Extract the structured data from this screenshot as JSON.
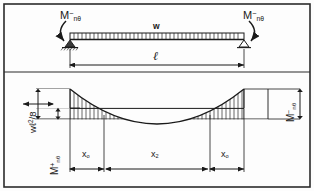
{
  "figure": {
    "kind": "structural-engineering-diagram",
    "border_color": "#2b2b2b",
    "line_color": "#1a1a1a",
    "background": "#fdfdfd"
  },
  "beam_panel": {
    "moment_left_label": "M",
    "moment_left_sup": "−",
    "moment_left_sub": "nθ",
    "moment_right_label": "M",
    "moment_right_sup": "−",
    "moment_right_sub": "nθ",
    "load_label": "w",
    "span_label": "ℓ",
    "left_support": "pinned-support",
    "right_support": "roller-support",
    "load_type": "uniformly-distributed-load"
  },
  "moment_panel": {
    "peak_label": "wℓ2/8",
    "peak_label_base": "wℓ",
    "peak_label_exp": "2",
    "peak_label_tail": "/8",
    "positive_moment_label": "M",
    "positive_moment_sup": "+",
    "positive_moment_sub": "nθ",
    "negative_moment_label": "M",
    "negative_moment_sup": "−",
    "negative_moment_sub": "nθ",
    "segment_left_label": "x",
    "segment_left_sub": "o",
    "segment_mid_label": "x",
    "segment_mid_sub": "2",
    "segment_right_label": "x",
    "segment_right_sub": "o",
    "curve_type": "parabola",
    "hatch_style": "vertical-lines"
  }
}
